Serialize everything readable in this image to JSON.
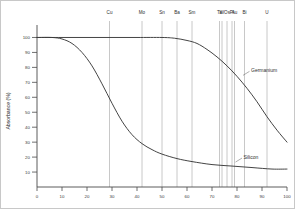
{
  "chart_data": {
    "type": "line",
    "title": "",
    "xlabel": "",
    "ylabel": "Absorbance (%)",
    "xlim": [
      0,
      100
    ],
    "ylim": [
      0,
      105
    ],
    "grid": false,
    "legend_position": "inline-annotation",
    "xticks": [
      "0",
      "10",
      "20",
      "30",
      "40",
      "50",
      "60",
      "70",
      "80",
      "90",
      "100"
    ],
    "xtick_values": [
      0,
      10,
      20,
      30,
      40,
      50,
      60,
      70,
      80,
      90,
      100
    ],
    "yticks": [
      "10",
      "20",
      "30",
      "40",
      "50",
      "60",
      "70",
      "80",
      "90",
      "100"
    ],
    "ytick_values": [
      10,
      20,
      30,
      40,
      50,
      60,
      70,
      80,
      90,
      100
    ],
    "element_markers": [
      {
        "label": "Cu",
        "x": 29
      },
      {
        "label": "Mo",
        "x": 42
      },
      {
        "label": "Sn",
        "x": 50
      },
      {
        "label": "Ba",
        "x": 56
      },
      {
        "label": "Sm",
        "x": 62
      },
      {
        "label": "Ta",
        "x": 73
      },
      {
        "label": "W",
        "x": 74
      },
      {
        "label": "Os",
        "x": 76
      },
      {
        "label": "Pt",
        "x": 78
      },
      {
        "label": "Au",
        "x": 79
      },
      {
        "label": "Bi",
        "x": 83
      },
      {
        "label": "U",
        "x": 92
      }
    ],
    "series": [
      {
        "name": "Germanium",
        "label_x": 82,
        "label_y": 74,
        "points": [
          [
            0,
            100
          ],
          [
            10,
            100
          ],
          [
            20,
            100
          ],
          [
            30,
            100
          ],
          [
            40,
            100
          ],
          [
            50,
            100
          ],
          [
            55,
            99.5
          ],
          [
            60,
            98
          ],
          [
            64,
            96
          ],
          [
            68,
            92
          ],
          [
            72,
            87
          ],
          [
            76,
            81
          ],
          [
            80,
            74
          ],
          [
            84,
            66
          ],
          [
            88,
            57
          ],
          [
            92,
            47
          ],
          [
            96,
            38
          ],
          [
            100,
            30
          ]
        ]
      },
      {
        "name": "Silicon",
        "label_x": 79,
        "label_y": 16,
        "points": [
          [
            0,
            100
          ],
          [
            6,
            100
          ],
          [
            10,
            99
          ],
          [
            14,
            96
          ],
          [
            18,
            90
          ],
          [
            22,
            81
          ],
          [
            26,
            69
          ],
          [
            30,
            56
          ],
          [
            34,
            44
          ],
          [
            38,
            35
          ],
          [
            42,
            29
          ],
          [
            46,
            25
          ],
          [
            50,
            22
          ],
          [
            56,
            19
          ],
          [
            62,
            17
          ],
          [
            70,
            15
          ],
          [
            78,
            14
          ],
          [
            86,
            13
          ],
          [
            94,
            12
          ],
          [
            100,
            12
          ]
        ]
      }
    ]
  }
}
